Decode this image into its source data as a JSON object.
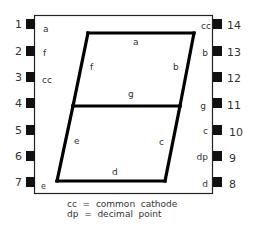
{
  "diagram": {
    "title": "",
    "pins_left": [
      {
        "num": "1",
        "label": "a"
      },
      {
        "num": "2",
        "label": "f"
      },
      {
        "num": "3",
        "label": "cc"
      },
      {
        "num": "4",
        "label": ""
      },
      {
        "num": "5",
        "label": ""
      },
      {
        "num": "6",
        "label": ""
      },
      {
        "num": "7",
        "label": "e"
      }
    ],
    "pins_right": [
      {
        "num": "14",
        "label": "cc"
      },
      {
        "num": "13",
        "label": "b"
      },
      {
        "num": "12",
        "label": ""
      },
      {
        "num": "11",
        "label": "g"
      },
      {
        "num": "10",
        "label": "c"
      },
      {
        "num": "9",
        "label": "dp"
      },
      {
        "num": "8",
        "label": "d"
      }
    ],
    "segments": {
      "a": "a",
      "b": "b",
      "c": "c",
      "d": "d",
      "e": "e",
      "f": "f",
      "g": "g"
    },
    "legend": [
      "cc  =  common  cathode",
      "dp  =  decimal  point"
    ]
  }
}
